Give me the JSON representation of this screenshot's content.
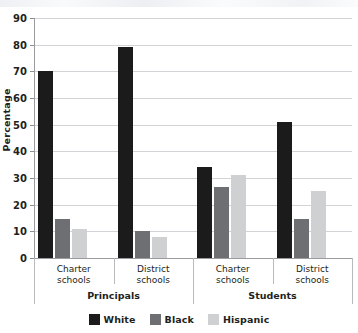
{
  "chart_data": {
    "type": "bar",
    "title": "",
    "xlabel": "",
    "ylabel": "Percentage",
    "ylim": [
      0,
      90
    ],
    "ytick_step": 10,
    "yticks": [
      0,
      10,
      20,
      30,
      40,
      50,
      60,
      70,
      80,
      90
    ],
    "grid": true,
    "legend_position": "bottom",
    "categories": [
      "Charter\nschools",
      "District\nschools",
      "Charter\nschools",
      "District\nschools"
    ],
    "supergroups": [
      {
        "label": "Principals",
        "categories": [
          0,
          1
        ]
      },
      {
        "label": "Students",
        "categories": [
          2,
          3
        ]
      }
    ],
    "series": [
      {
        "name": "White",
        "color": "#1b1b1b",
        "values": [
          70,
          79,
          34,
          51
        ]
      },
      {
        "name": "Black",
        "color": "#6e6f72",
        "values": [
          14.7,
          10,
          26.5,
          14.7
        ]
      },
      {
        "name": "Hispanic",
        "color": "#cfd0d2",
        "values": [
          11,
          8,
          31,
          25
        ]
      }
    ]
  },
  "legend": {
    "items": [
      {
        "label": "White",
        "color": "#1b1b1b"
      },
      {
        "label": "Black",
        "color": "#6e6f72"
      },
      {
        "label": "Hispanic",
        "color": "#cfd0d2"
      }
    ]
  }
}
